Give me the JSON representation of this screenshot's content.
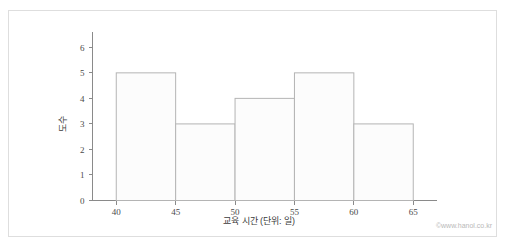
{
  "chart_data": {
    "type": "bar",
    "title": "",
    "subtitle": "",
    "xlabel": "교육 시간 (단위: 일)",
    "ylabel": "도수",
    "categories": [
      "40-45",
      "45-50",
      "50-55",
      "55-60",
      "60-65"
    ],
    "bin_edges": [
      40,
      45,
      50,
      55,
      60,
      65
    ],
    "values": [
      5,
      3,
      4,
      5,
      3
    ],
    "xlim": [
      38,
      67
    ],
    "ylim": [
      0,
      6.6
    ],
    "x_ticks": [
      "40",
      "45",
      "50",
      "55",
      "60",
      "65"
    ],
    "x_tick_values": [
      40,
      45,
      50,
      55,
      60,
      65
    ],
    "y_ticks": [
      "0",
      "1",
      "2",
      "3",
      "4",
      "5",
      "6"
    ],
    "y_tick_values": [
      0,
      1,
      2,
      3,
      4,
      5,
      6
    ],
    "grid": false,
    "legend": null,
    "legend_position": "none",
    "annotations": [],
    "colors": {
      "bar_fill": "#fcfcfc",
      "bar_stroke": "#b4b4b4",
      "axis": "#8a8a8a",
      "text": "#4a4a4a",
      "frame": "#dedede",
      "watermark": "#b9b9b9",
      "background": "#ffffff"
    }
  },
  "footer": {
    "watermark": "©www.hanol.co.kr"
  }
}
